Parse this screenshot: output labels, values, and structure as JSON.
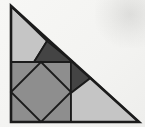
{
  "diagram": {
    "canvas": {
      "width": 145,
      "height": 127,
      "background": "#f6f6f4"
    },
    "palette": {
      "paper": "#f6f6f4",
      "light_gray": "#c5c5c5",
      "medium_gray": "#8e8e8e",
      "dark_gray": "#444444",
      "outline": "#1b1b1b"
    },
    "shapes": [
      {
        "name": "upper-left-light-quad",
        "fill": "light_gray",
        "stroke_width": 1.8,
        "points": [
          [
            11,
            6
          ],
          [
            47,
            41
          ],
          [
            34,
            62
          ],
          [
            11,
            62
          ]
        ]
      },
      {
        "name": "upper-dark-triangle",
        "fill": "dark_gray",
        "stroke_width": 1.8,
        "points": [
          [
            34,
            62
          ],
          [
            47,
            41
          ],
          [
            73,
            62
          ]
        ]
      },
      {
        "name": "corner-square",
        "fill": "medium_gray",
        "stroke_width": 1.8,
        "points": [
          [
            11,
            62
          ],
          [
            71,
            62
          ],
          [
            71,
            122
          ],
          [
            11,
            122
          ]
        ]
      },
      {
        "name": "inscribed-diamond",
        "fill": "medium_gray",
        "stroke_width": 1.8,
        "points": [
          [
            41,
            62
          ],
          [
            71,
            92
          ],
          [
            41,
            122
          ],
          [
            11,
            92
          ]
        ]
      },
      {
        "name": "right-dark-triangle",
        "fill": "dark_gray",
        "stroke_width": 1.6,
        "points": [
          [
            71,
            60.5
          ],
          [
            90.5,
            78
          ],
          [
            71,
            93
          ]
        ]
      },
      {
        "name": "lower-right-light-quad",
        "fill": "light_gray",
        "stroke_width": 1.8,
        "points": [
          [
            71,
            93
          ],
          [
            90.5,
            78
          ],
          [
            139,
            122
          ],
          [
            71,
            122
          ]
        ]
      },
      {
        "name": "outer-right-triangle",
        "fill": "none",
        "stroke_width": 2.6,
        "points": [
          [
            11,
            6
          ],
          [
            11,
            122
          ],
          [
            139,
            122
          ]
        ]
      }
    ]
  }
}
